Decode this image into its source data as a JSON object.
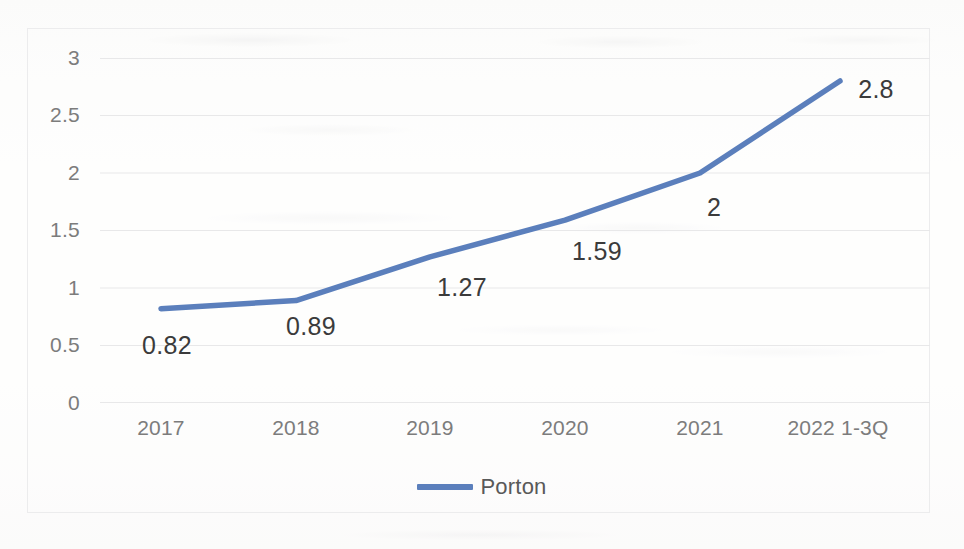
{
  "chart_data": {
    "type": "line",
    "title": "",
    "subtitle": "",
    "xlabel": "",
    "ylabel": "",
    "categories": [
      "2017",
      "2018",
      "2019",
      "2020",
      "2021",
      "2022 1-3Q"
    ],
    "series": [
      {
        "name": "Porton",
        "values": [
          0.82,
          0.89,
          1.27,
          1.59,
          2,
          2.8
        ],
        "color": "#5b7fbc"
      }
    ],
    "point_labels": [
      "0.82",
      "0.89",
      "1.27",
      "1.59",
      "2",
      "2.8"
    ],
    "y_ticks": [
      "0",
      "0.5",
      "1",
      "1.5",
      "2",
      "2.5",
      "3"
    ],
    "y_tick_values": [
      0,
      0.5,
      1,
      1.5,
      2,
      2.5,
      3
    ],
    "ylim": [
      0,
      3
    ],
    "grid": "horizontal",
    "legend": {
      "position": "bottom-center",
      "entries": [
        {
          "label": "Porton",
          "color": "#5b7fbc"
        }
      ]
    },
    "plot_border": true,
    "border_color": "#ececed",
    "gridline_color": "#e8e8e9",
    "tick_label_color": "#7c7c7c",
    "data_label_color": "#3b3b3b"
  }
}
